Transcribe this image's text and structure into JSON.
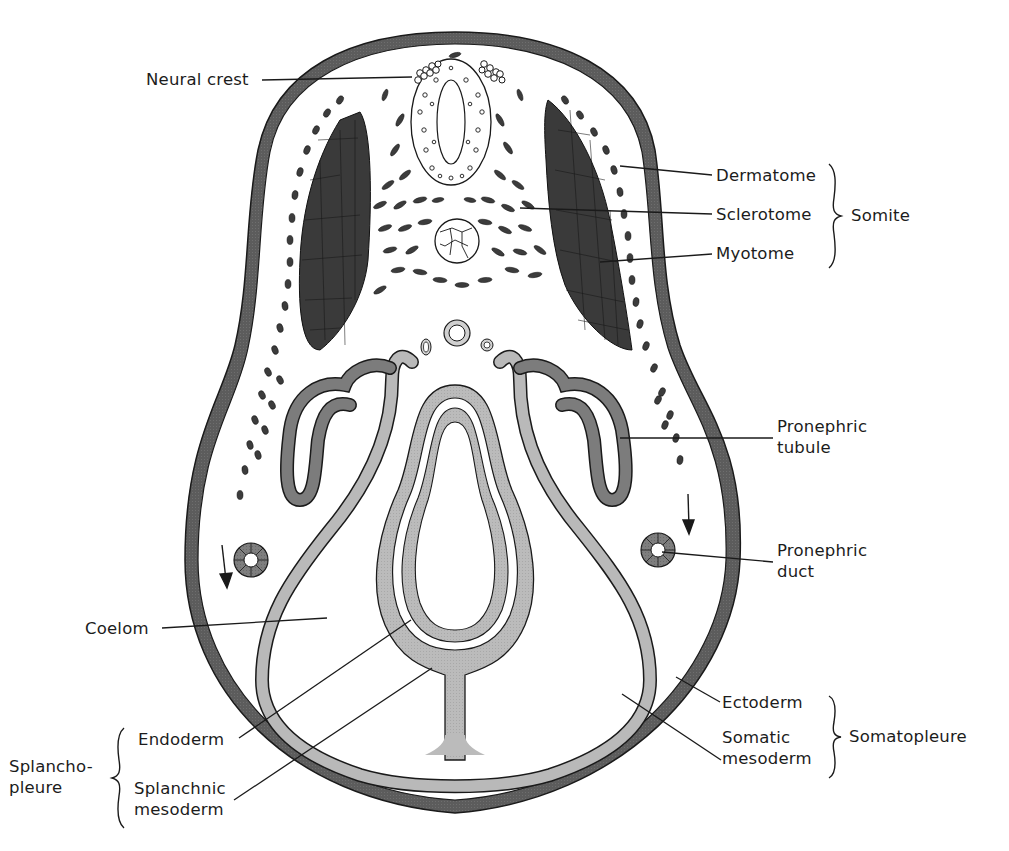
{
  "figure": {
    "colors": {
      "ectoderm": "#5a5a5a",
      "myotome": "#3a3a3a",
      "pronephric_tubule": "#7c7c7c",
      "mesoderm_light": "#b9b9b9",
      "endoderm": "#c4c4c4",
      "outline": "#1a1a1a",
      "background": "#ffffff"
    }
  },
  "labels": {
    "neural_crest": "Neural crest",
    "dermatome": "Dermatome",
    "sclerotome": "Sclerotome",
    "myotome": "Myotome",
    "somite": "Somite",
    "pronephric_tubule_1": "Pronephric",
    "pronephric_tubule_2": "tubule",
    "pronephric_duct_1": "Pronephric",
    "pronephric_duct_2": "duct",
    "coelom": "Coelom",
    "ectoderm": "Ectoderm",
    "somatic_mesoderm_1": "Somatic",
    "somatic_mesoderm_2": "mesoderm",
    "somatopleure": "Somatopleure",
    "endoderm": "Endoderm",
    "splanchnic_mesoderm_1": "Splanchnic",
    "splanchnic_mesoderm_2": "mesoderm",
    "splanchnopleure_1": "Splancho-",
    "splanchnopleure_2": "pleure"
  },
  "groups": [
    {
      "name": "Somite",
      "members": [
        "Dermatome",
        "Sclerotome",
        "Myotome"
      ]
    },
    {
      "name": "Somatopleure",
      "members": [
        "Ectoderm",
        "Somatic mesoderm"
      ]
    },
    {
      "name": "Splanchnopleure",
      "members": [
        "Endoderm",
        "Splanchnic mesoderm"
      ]
    }
  ]
}
